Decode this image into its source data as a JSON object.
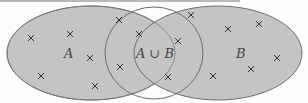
{
  "diagram": {
    "type": "venn",
    "sets": [
      {
        "id": "A",
        "label": "A"
      },
      {
        "id": "B",
        "label": "B"
      }
    ],
    "overlap_label": "A ∪ B",
    "colors": {
      "fill": "#c4c4c4",
      "stroke": "#6e6e6e",
      "background": "#fdfdfd",
      "marker": "#333333"
    },
    "markers": {
      "symbol": "×",
      "count": 16
    }
  }
}
